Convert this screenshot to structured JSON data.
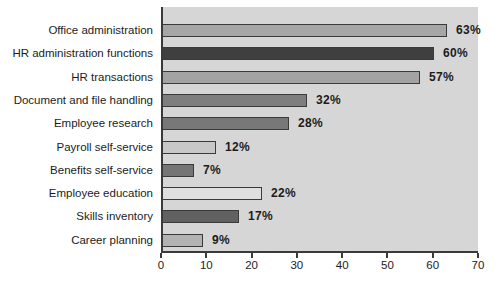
{
  "page": {
    "background": "#ffffff"
  },
  "chart_data": {
    "type": "bar",
    "orientation": "horizontal",
    "title": "",
    "xlabel": "",
    "ylabel": "",
    "xlim": [
      0,
      70
    ],
    "x_ticks": [
      "0",
      "10",
      "20",
      "30",
      "40",
      "50",
      "60",
      "70"
    ],
    "grid": false,
    "legend": false,
    "plot_background": "#d6d6d6",
    "axis_color": "#3a3a3a",
    "bar_border_color": "#3a3a3a",
    "text_color": "#1c1c1c",
    "categories": [
      "Office administration",
      "HR administration functions",
      "HR transactions",
      "Document and file handling",
      "Employee research",
      "Payroll self-service",
      "Benefits self-service",
      "Employee education",
      "Skills inventory",
      "Career planning"
    ],
    "values": [
      63,
      60,
      57,
      32,
      28,
      12,
      7,
      22,
      17,
      9
    ],
    "value_labels": [
      "63%",
      "60%",
      "57%",
      "32%",
      "28%",
      "12%",
      "7%",
      "22%",
      "17%",
      "9%"
    ],
    "bar_colors": [
      "#a6a6a6",
      "#3f3f3f",
      "#a3a3a3",
      "#7e7e7e",
      "#787878",
      "#c8c8c8",
      "#757575",
      "#dfdfdf",
      "#616161",
      "#b2b2b2"
    ]
  }
}
